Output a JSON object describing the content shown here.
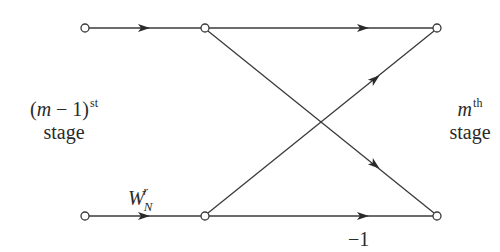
{
  "diagram": {
    "type": "butterfly-flow-graph",
    "colors": {
      "line": "#3a3a3a",
      "node_fill": "#ffffff",
      "text": "#2a2a2a"
    },
    "nodes": [
      {
        "id": "in-top",
        "x": 85,
        "y": 28
      },
      {
        "id": "mid-top",
        "x": 205,
        "y": 28
      },
      {
        "id": "out-top",
        "x": 437,
        "y": 28
      },
      {
        "id": "in-bottom",
        "x": 85,
        "y": 216
      },
      {
        "id": "mid-bottom",
        "x": 205,
        "y": 216
      },
      {
        "id": "out-bottom",
        "x": 437,
        "y": 216
      }
    ],
    "edges": [
      {
        "from": "in-top",
        "to": "mid-top",
        "gain": ""
      },
      {
        "from": "in-bottom",
        "to": "mid-bottom",
        "gain": "W_N^r"
      },
      {
        "from": "mid-top",
        "to": "out-top",
        "gain": ""
      },
      {
        "from": "mid-top",
        "to": "out-bottom",
        "gain": ""
      },
      {
        "from": "mid-bottom",
        "to": "out-top",
        "gain": ""
      },
      {
        "from": "mid-bottom",
        "to": "out-bottom",
        "gain": "-1"
      }
    ],
    "labels": {
      "left_stage": {
        "base": "(m − 1)",
        "sup": "st",
        "word": "stage"
      },
      "right_stage": {
        "base": "m",
        "sup": "th",
        "word": "stage"
      },
      "twiddle": {
        "base": "W",
        "sub": "N",
        "sup": "r"
      },
      "minus_one": "−1"
    }
  }
}
